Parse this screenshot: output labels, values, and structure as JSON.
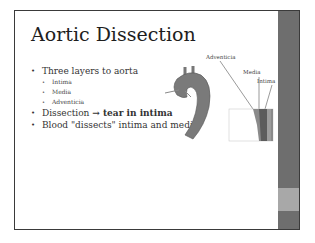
{
  "slide": {
    "title": "Aortic Dissection",
    "bullets": [
      {
        "text": "Three layers to aorta",
        "sub": [
          "Intima",
          "Media",
          "Adventicia"
        ]
      },
      {
        "text_pre": "Dissection ",
        "arrow": "→",
        "text_bold": " tear in intima"
      },
      {
        "text": "Blood \"dissects\" intima and media"
      }
    ],
    "figure": {
      "labels": {
        "adventicia": "Adventicia",
        "media": "Media",
        "intima": "Intima"
      }
    },
    "colors": {
      "sidebar_dark": "#6e6e6e",
      "sidebar_light": "#a8a8a8",
      "border": "#3a3a3a"
    }
  }
}
